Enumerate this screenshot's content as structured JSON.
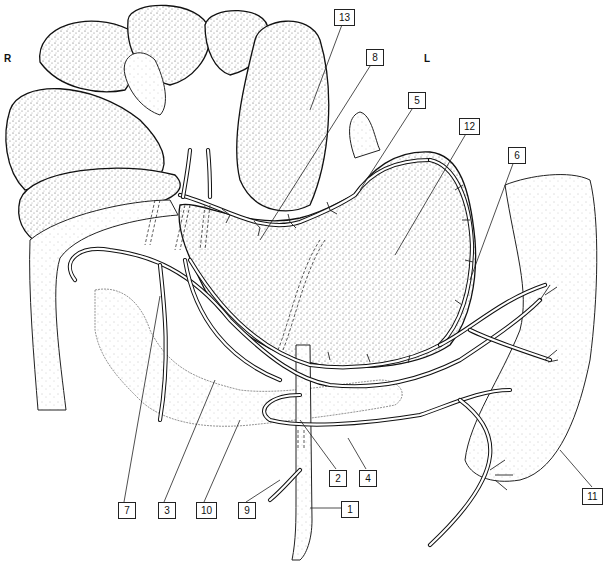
{
  "figure": {
    "type": "anatomical-line-drawing",
    "orientation": {
      "right": "R",
      "left": "L"
    },
    "labels": [
      {
        "id": "1",
        "text": "1",
        "x": 341,
        "y": 501
      },
      {
        "id": "2",
        "text": "2",
        "x": 329,
        "y": 470
      },
      {
        "id": "3",
        "text": "3",
        "x": 158,
        "y": 502
      },
      {
        "id": "4",
        "text": "4",
        "x": 359,
        "y": 470
      },
      {
        "id": "5",
        "text": "5",
        "x": 408,
        "y": 92
      },
      {
        "id": "6",
        "text": "6",
        "x": 508,
        "y": 147
      },
      {
        "id": "7",
        "text": "7",
        "x": 118,
        "y": 502
      },
      {
        "id": "8",
        "text": "8",
        "x": 366,
        "y": 49
      },
      {
        "id": "9",
        "text": "9",
        "x": 238,
        "y": 502
      },
      {
        "id": "10",
        "text": "10",
        "x": 198,
        "y": 502
      },
      {
        "id": "11",
        "text": "11",
        "x": 584,
        "y": 488
      },
      {
        "id": "12",
        "text": "12",
        "x": 461,
        "y": 118
      },
      {
        "id": "13",
        "text": "13",
        "x": 335,
        "y": 9
      }
    ]
  }
}
